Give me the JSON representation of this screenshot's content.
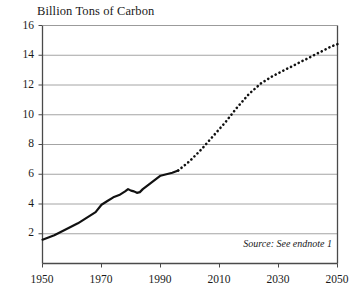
{
  "chart_data": {
    "type": "line",
    "title": "Billion Tons of Carbon",
    "xlabel": "",
    "ylabel": "Billion Tons of Carbon",
    "xlim": [
      1950,
      2050
    ],
    "ylim": [
      0,
      16
    ],
    "grid": true,
    "legend": null,
    "annotation": "Source: See endnote 1",
    "xticks": [
      1950,
      1970,
      1990,
      2010,
      2030,
      2050
    ],
    "yticks": [
      2,
      4,
      6,
      8,
      10,
      12,
      14,
      16
    ],
    "series": [
      {
        "name": "Historical carbon emissions",
        "style": "solid",
        "color": "#111111",
        "x": [
          1950,
          1952,
          1954,
          1956,
          1958,
          1960,
          1962,
          1964,
          1966,
          1968,
          1970,
          1972,
          1974,
          1976,
          1978,
          1979,
          1980,
          1981,
          1982,
          1983,
          1984,
          1986,
          1988,
          1990,
          1992,
          1994,
          1996
        ],
        "values": [
          1.6,
          1.75,
          1.9,
          2.1,
          2.3,
          2.5,
          2.7,
          2.95,
          3.2,
          3.45,
          3.95,
          4.2,
          4.45,
          4.6,
          4.85,
          5.0,
          4.9,
          4.85,
          4.75,
          4.8,
          5.0,
          5.3,
          5.6,
          5.9,
          6.0,
          6.1,
          6.25
        ]
      },
      {
        "name": "Projected carbon emissions",
        "style": "dotted",
        "color": "#111111",
        "x": [
          1996,
          2000,
          2004,
          2008,
          2012,
          2016,
          2020,
          2024,
          2028,
          2032,
          2036,
          2040,
          2044,
          2048,
          2050
        ],
        "values": [
          6.25,
          6.9,
          7.7,
          8.6,
          9.5,
          10.5,
          11.4,
          12.1,
          12.6,
          13.0,
          13.4,
          13.8,
          14.2,
          14.6,
          14.75
        ]
      }
    ]
  },
  "axis": {
    "ytick_labels": [
      "16",
      "14",
      "12",
      "10",
      "8",
      "6",
      "4",
      "2"
    ],
    "xtick_labels": [
      "1950",
      "1970",
      "1990",
      "2010",
      "2030",
      "2050"
    ]
  },
  "colors": {
    "line": "#111111",
    "grid": "#9a9a9a",
    "frame": "#4a4a4a",
    "background": "#ffffff",
    "text": "#1a1a1a"
  }
}
